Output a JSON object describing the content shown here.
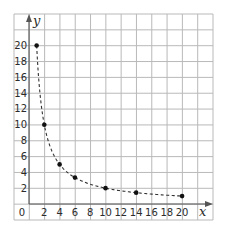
{
  "chart_data": {
    "type": "scatter",
    "title": "",
    "xlabel": "x",
    "ylabel": "y",
    "xlim": [
      0,
      20
    ],
    "ylim": [
      0,
      20
    ],
    "grid": true,
    "legend": null,
    "x_ticks": [
      0,
      2,
      4,
      6,
      8,
      10,
      12,
      14,
      16,
      18,
      20
    ],
    "y_ticks": [
      2,
      4,
      6,
      8,
      10,
      12,
      14,
      16,
      18,
      20
    ],
    "origin_label": "0",
    "series": [
      {
        "name": "points",
        "marker": "dot",
        "connect": "dashed-curve",
        "x": [
          1,
          2,
          4,
          6,
          10,
          14,
          20
        ],
        "y": [
          20,
          10,
          5,
          3.33,
          2,
          1.43,
          1
        ]
      }
    ],
    "curve_function": "y = 20/x"
  },
  "colors": {
    "grid": "#b9b9b9",
    "axis": "#555555",
    "points": "#111111",
    "text": "#2b2b2b"
  }
}
